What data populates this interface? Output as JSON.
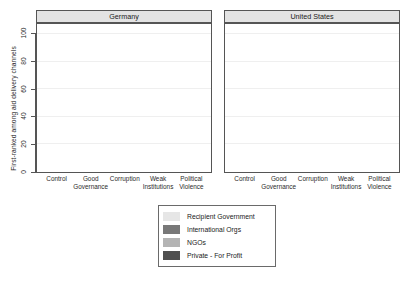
{
  "chart_data": {
    "type": "bar",
    "subtype": "stacked-bar",
    "title": "",
    "xlabel": "",
    "ylabel": "First-ranked among aid delivery channels",
    "ylim": [
      0,
      100
    ],
    "yticks": [
      0,
      20,
      40,
      60,
      80,
      100
    ],
    "grid": true,
    "legend_position": "bottom-center",
    "facet_labels": [
      "Germany",
      "United States"
    ],
    "categories": [
      "Control",
      "Good Governance",
      "Corruption",
      "Weak Institutions",
      "Political Violence"
    ],
    "category_lines": [
      [
        "Control",
        ""
      ],
      [
        "Good",
        "Governance"
      ],
      [
        "Corruption",
        ""
      ],
      [
        "Weak",
        "Institutions"
      ],
      [
        "Political",
        "Violence"
      ]
    ],
    "series_order_bottom_to_top": [
      "Private - For Profit",
      "NGOs",
      "International Orgs",
      "Recipient Government"
    ],
    "colors": {
      "Recipient Government": "#e6e6e6",
      "International Orgs": "#787878",
      "NGOs": "#b4b4b4",
      "Private - For Profit": "#4f4f4f"
    },
    "panels": [
      {
        "name": "Germany",
        "series": [
          {
            "name": "Private - For Profit",
            "values": [
              8,
              8,
              9,
              8,
              8
            ]
          },
          {
            "name": "NGOs",
            "values": [
              14,
              14,
              22,
              18,
              14
            ]
          },
          {
            "name": "International Orgs",
            "values": [
              39,
              33,
              40,
              43,
              41
            ]
          },
          {
            "name": "Recipient Government",
            "values": [
              39,
              45,
              29,
              31,
              37
            ]
          }
        ],
        "cumulative_tops": {
          "Private - For Profit": [
            8,
            8,
            9,
            8,
            8
          ],
          "NGOs": [
            22,
            22,
            31,
            26,
            22
          ],
          "International Orgs": [
            61,
            55,
            71,
            69,
            63
          ],
          "Recipient Government": [
            100,
            100,
            100,
            100,
            100
          ]
        }
      },
      {
        "name": "United States",
        "series": [
          {
            "name": "Private - For Profit",
            "values": [
              11,
              12,
              11,
              11,
              10
            ]
          },
          {
            "name": "NGOs",
            "values": [
              34,
              33,
              36,
              34,
              35
            ]
          },
          {
            "name": "International Orgs",
            "values": [
              25,
              23,
              35,
              35,
              35
            ]
          },
          {
            "name": "Recipient Government",
            "values": [
              30,
              32,
              18,
              20,
              20
            ]
          }
        ],
        "cumulative_tops": {
          "Private - For Profit": [
            11,
            12,
            11,
            11,
            10
          ],
          "NGOs": [
            45,
            45,
            47,
            45,
            45
          ],
          "International Orgs": [
            70,
            68,
            82,
            80,
            80
          ],
          "Recipient Government": [
            100,
            100,
            100,
            100,
            100
          ]
        }
      }
    ],
    "legend_entries": [
      {
        "label": "Recipient Government",
        "color": "#e6e6e6"
      },
      {
        "label": "International Orgs",
        "color": "#787878"
      },
      {
        "label": "NGOs",
        "color": "#b4b4b4"
      },
      {
        "label": "Private - For Profit",
        "color": "#4f4f4f"
      }
    ]
  }
}
